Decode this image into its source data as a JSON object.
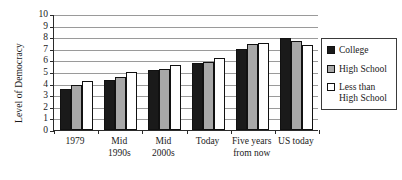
{
  "chart_data": {
    "type": "bar",
    "title": "",
    "xlabel": "",
    "ylabel": "Level of Democracy",
    "ylim": [
      0,
      10
    ],
    "ytick_step": 1,
    "yticks": [
      "10",
      "9",
      "8",
      "7",
      "6",
      "5",
      "4",
      "3",
      "2",
      "1",
      "0"
    ],
    "grid": true,
    "legend_position": "right",
    "categories": [
      "1979",
      "Mid\n1990s",
      "Mid\n2000s",
      "Today",
      "Five years\nfrom now",
      "US today"
    ],
    "series": [
      {
        "name": "College",
        "color": "#1a1a1a",
        "values": [
          3.5,
          4.3,
          5.2,
          5.75,
          7.0,
          7.9
        ]
      },
      {
        "name": "High School",
        "color": "#a8a8a8",
        "values": [
          3.9,
          4.6,
          5.3,
          5.9,
          7.4,
          7.65
        ]
      },
      {
        "name": "Less than\nHigh School",
        "color": "#ffffff",
        "values": [
          4.2,
          5.0,
          5.6,
          6.2,
          7.5,
          7.3
        ]
      }
    ]
  },
  "legend": {
    "items": [
      {
        "label": "College",
        "swatch": "college"
      },
      {
        "label": "High School",
        "swatch": "highschool"
      },
      {
        "label": "Less than\nHigh School",
        "swatch": "lessthan"
      }
    ]
  }
}
